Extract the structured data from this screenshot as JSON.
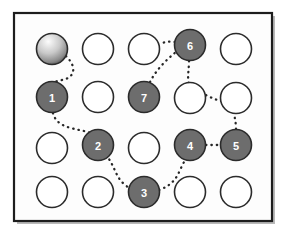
{
  "figure": {
    "type": "grid-path-diagram",
    "background_color": "#ffffff",
    "frame": {
      "name": "outer-frame",
      "x": 14,
      "y": 13,
      "width": 258,
      "height": 208,
      "stroke_color": "#1d1d1d",
      "stroke_width": 2.2,
      "fill_color": "#fdfdfd"
    },
    "shadow": {
      "color": "#b9b9b9",
      "offset_x": 3,
      "offset_y": 3
    }
  },
  "grid": {
    "columns": 5,
    "rows": 4,
    "column_centers_px": [
      52,
      98,
      144,
      190,
      236
    ],
    "row_centers_px": [
      49,
      97,
      148,
      192
    ],
    "node_radius_px": 15.5,
    "empty_node": {
      "fill_color": "#ffffff",
      "stroke_color": "#2b2b2b",
      "stroke_width": 1.6
    },
    "filled_node": {
      "fill_color": "#6d6d6d",
      "stroke_color": "#2b2b2b",
      "stroke_width": 1.6,
      "label_color": "#ffffff"
    },
    "start_node": {
      "gradient_from": "#fcfcfc",
      "gradient_to": "#1a1a1a",
      "stroke_color": "#2b2b2b",
      "stroke_width": 1.6
    }
  },
  "nodes": [
    {
      "id": "start",
      "label": "",
      "row": 1,
      "col": 1,
      "cx": 52,
      "cy": 49,
      "state": "start"
    },
    {
      "id": "r1c2",
      "label": "",
      "row": 1,
      "col": 2,
      "cx": 98,
      "cy": 49,
      "state": "empty"
    },
    {
      "id": "r1c3",
      "label": "",
      "row": 1,
      "col": 3,
      "cx": 144,
      "cy": 49,
      "state": "empty"
    },
    {
      "id": "n6",
      "label": "6",
      "row": 1,
      "col": 4,
      "cx": 190,
      "cy": 45,
      "state": "filled"
    },
    {
      "id": "r1c5",
      "label": "",
      "row": 1,
      "col": 5,
      "cx": 236,
      "cy": 49,
      "state": "empty"
    },
    {
      "id": "n1",
      "label": "1",
      "row": 2,
      "col": 1,
      "cx": 52,
      "cy": 97,
      "state": "filled"
    },
    {
      "id": "r2c2",
      "label": "",
      "row": 2,
      "col": 2,
      "cx": 98,
      "cy": 97,
      "state": "empty"
    },
    {
      "id": "n7",
      "label": "7",
      "row": 2,
      "col": 3,
      "cx": 144,
      "cy": 97,
      "state": "filled"
    },
    {
      "id": "r2c4",
      "label": "",
      "row": 2,
      "col": 4,
      "cx": 190,
      "cy": 98,
      "state": "empty"
    },
    {
      "id": "r2c5",
      "label": "",
      "row": 2,
      "col": 5,
      "cx": 236,
      "cy": 98,
      "state": "empty"
    },
    {
      "id": "r3c1",
      "label": "",
      "row": 3,
      "col": 1,
      "cx": 52,
      "cy": 148,
      "state": "empty"
    },
    {
      "id": "n2",
      "label": "2",
      "row": 3,
      "col": 2,
      "cx": 98,
      "cy": 145,
      "state": "filled"
    },
    {
      "id": "r3c3",
      "label": "",
      "row": 3,
      "col": 3,
      "cx": 144,
      "cy": 148,
      "state": "empty"
    },
    {
      "id": "n4",
      "label": "4",
      "row": 3,
      "col": 4,
      "cx": 190,
      "cy": 145,
      "state": "filled"
    },
    {
      "id": "n5",
      "label": "5",
      "row": 3,
      "col": 5,
      "cx": 236,
      "cy": 145,
      "state": "filled"
    },
    {
      "id": "r4c1",
      "label": "",
      "row": 4,
      "col": 1,
      "cx": 52,
      "cy": 192,
      "state": "empty"
    },
    {
      "id": "r4c2",
      "label": "",
      "row": 4,
      "col": 2,
      "cx": 98,
      "cy": 192,
      "state": "empty"
    },
    {
      "id": "n3",
      "label": "3",
      "row": 4,
      "col": 3,
      "cx": 144,
      "cy": 192,
      "state": "filled"
    },
    {
      "id": "r4c4",
      "label": "",
      "row": 4,
      "col": 4,
      "cx": 190,
      "cy": 192,
      "state": "empty"
    },
    {
      "id": "r4c5",
      "label": "",
      "row": 4,
      "col": 5,
      "cx": 236,
      "cy": 192,
      "state": "empty"
    }
  ],
  "path": {
    "style": "dotted",
    "stroke_color": "#262626",
    "stroke_width": 2.3,
    "dash_array": "0.4 5",
    "linecap": "round",
    "segments": [
      {
        "name": "start-to-1",
        "from": "start",
        "to": "n1",
        "d": "M 66 56 C 78 68 74 78 62 80 C 48 83 46 86 50 82"
      },
      {
        "name": "1-to-2",
        "from": "n1",
        "to": "n2",
        "d": "M 53 113 C 56 126 70 128 84 131 C 92 133 96 137 98 130"
      },
      {
        "name": "2-to-3",
        "from": "n2",
        "to": "n3",
        "d": "M 106 155 C 115 166 115 176 124 184 C 130 189 134 192 129 192"
      },
      {
        "name": "3-to-4",
        "from": "n3",
        "to": "n4",
        "d": "M 159 190 C 170 186 176 180 180 170 C 184 162 186 156 190 160"
      },
      {
        "name": "4-to-5",
        "from": "n4",
        "to": "n5",
        "d": "M 206 145 L 221 145"
      },
      {
        "name": "5-up-to-r2c5",
        "from": "n5",
        "to": "r2c5",
        "d": "M 236 129 C 236 120 233 112 233 106 C 233 102 234 100 236 101"
      },
      {
        "name": "r2c4-to-r2c5",
        "from": "r2c4",
        "to": "r2c5",
        "d": "M 206 95 C 214 99 222 103 230 101"
      },
      {
        "name": "6-to-r2c4",
        "from": "n6",
        "to": "r2c4",
        "d": "M 189 61 C 189 70 187 78 189 84"
      },
      {
        "name": "7-to-6",
        "from": "n7",
        "to": "n6",
        "d": "M 150 82 C 156 70 166 60 176 52 C 180 49 182 48 180 50"
      },
      {
        "name": "6-left-tail",
        "from": "n6",
        "to": "r1c3",
        "d": "M 175 42 C 169 41 164 42 160 44"
      }
    ]
  },
  "sequence": {
    "description": "Numbered visit order along the dotted route",
    "order": [
      "start",
      "1",
      "2",
      "3",
      "4",
      "5",
      "6",
      "7"
    ]
  }
}
